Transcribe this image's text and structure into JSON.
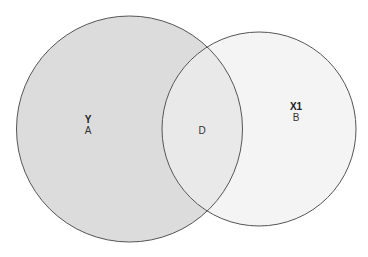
{
  "diagram": {
    "type": "venn",
    "colors": {
      "set_a_fill": "#dcdcdc",
      "set_b_fill": "#f4f4f4",
      "intersection_fill": "#e9e9e9",
      "stroke": "#555555",
      "background": "#ffffff"
    },
    "sets": [
      {
        "id": "A",
        "title": "Y",
        "label": "A"
      },
      {
        "id": "B",
        "title": "X1",
        "label": "B"
      }
    ],
    "intersection": {
      "label": "D"
    }
  }
}
